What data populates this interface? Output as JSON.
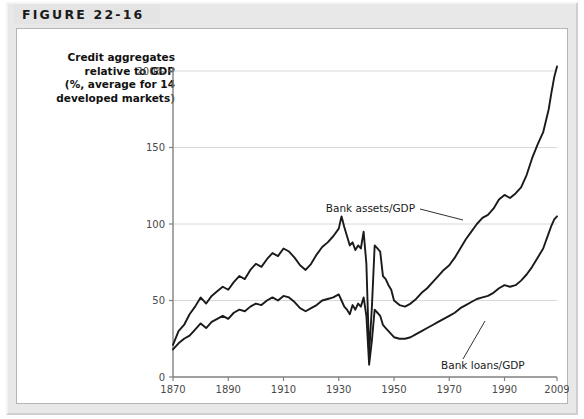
{
  "figure": {
    "tab_label": "FIGURE 22-16"
  },
  "axis_caption": {
    "line1": "Credit aggregates",
    "line2": "relative to GDP",
    "line3": "(%, average for 14",
    "line4": "developed markets)"
  },
  "annotations": {
    "assets_label": "Bank assets/GDP",
    "loans_label": "Bank loans/GDP"
  },
  "colors": {
    "line": "#1a1a1a",
    "grid": "#d8d8d8",
    "axis": "#808080",
    "panel_bg": "#ffffff",
    "mount_bg": "#e8e8e8",
    "tab_bg": "#e4e4e4",
    "tick_text": "#4a4a4a"
  },
  "chart_data": {
    "type": "line",
    "title": "",
    "xlabel": "",
    "ylabel": "Credit aggregates relative to GDP (%, average for 14 developed markets)",
    "xlim": [
      1870,
      2009
    ],
    "ylim": [
      0,
      200
    ],
    "yticks": [
      0,
      50,
      100,
      150,
      200
    ],
    "ytick_labels": [
      "0",
      "50",
      "100",
      "150",
      "200%"
    ],
    "xticks": [
      1870,
      1890,
      1910,
      1930,
      1950,
      1970,
      1990,
      2009
    ],
    "xtick_labels": [
      "1870",
      "1890",
      "1910",
      "1930",
      "1950",
      "1970",
      "1990",
      "2009"
    ],
    "grid": "horizontal",
    "legend": "annotated-inline",
    "series": [
      {
        "name": "Bank assets/GDP",
        "x": [
          1870,
          1872,
          1874,
          1876,
          1878,
          1880,
          1882,
          1884,
          1886,
          1888,
          1890,
          1892,
          1894,
          1896,
          1898,
          1900,
          1902,
          1904,
          1906,
          1908,
          1910,
          1912,
          1914,
          1916,
          1918,
          1920,
          1922,
          1924,
          1926,
          1928,
          1930,
          1931,
          1932,
          1933,
          1934,
          1935,
          1936,
          1937,
          1938,
          1939,
          1940,
          1941,
          1942,
          1943,
          1944,
          1945,
          1946,
          1947,
          1948,
          1949,
          1950,
          1952,
          1954,
          1956,
          1958,
          1960,
          1962,
          1964,
          1966,
          1968,
          1970,
          1972,
          1974,
          1976,
          1978,
          1980,
          1982,
          1984,
          1986,
          1988,
          1990,
          1992,
          1994,
          1996,
          1998,
          2000,
          2002,
          2004,
          2006,
          2007,
          2008,
          2009
        ],
        "values": [
          21,
          30,
          34,
          41,
          46,
          52,
          48,
          53,
          56,
          59,
          57,
          62,
          66,
          64,
          70,
          74,
          72,
          77,
          81,
          79,
          84,
          82,
          78,
          73,
          70,
          74,
          80,
          85,
          88,
          92,
          97,
          105,
          98,
          92,
          86,
          88,
          83,
          86,
          84,
          95,
          74,
          15,
          46,
          86,
          84,
          82,
          66,
          64,
          60,
          57,
          50,
          47,
          46,
          48,
          51,
          55,
          58,
          62,
          66,
          70,
          73,
          78,
          84,
          90,
          95,
          100,
          104,
          106,
          110,
          116,
          119,
          117,
          120,
          124,
          132,
          143,
          152,
          160,
          175,
          186,
          196,
          203
        ]
      },
      {
        "name": "Bank loans/GDP",
        "x": [
          1870,
          1872,
          1874,
          1876,
          1878,
          1880,
          1882,
          1884,
          1886,
          1888,
          1890,
          1892,
          1894,
          1896,
          1898,
          1900,
          1902,
          1904,
          1906,
          1908,
          1910,
          1912,
          1914,
          1916,
          1918,
          1920,
          1922,
          1924,
          1926,
          1928,
          1930,
          1931,
          1932,
          1933,
          1934,
          1935,
          1936,
          1937,
          1938,
          1939,
          1940,
          1941,
          1942,
          1943,
          1944,
          1945,
          1946,
          1947,
          1948,
          1949,
          1950,
          1952,
          1954,
          1956,
          1958,
          1960,
          1962,
          1964,
          1966,
          1968,
          1970,
          1972,
          1974,
          1976,
          1978,
          1980,
          1982,
          1984,
          1986,
          1988,
          1990,
          1992,
          1994,
          1996,
          1998,
          2000,
          2002,
          2004,
          2006,
          2007,
          2008,
          2009
        ],
        "values": [
          18,
          22,
          25,
          27,
          31,
          35,
          32,
          36,
          38,
          40,
          38,
          42,
          44,
          43,
          46,
          48,
          47,
          50,
          52,
          50,
          53,
          52,
          49,
          45,
          43,
          45,
          47,
          50,
          51,
          52,
          54,
          50,
          46,
          44,
          41,
          47,
          44,
          48,
          46,
          52,
          40,
          8,
          24,
          44,
          42,
          40,
          34,
          32,
          30,
          28,
          26,
          25,
          25,
          26,
          28,
          30,
          32,
          34,
          36,
          38,
          40,
          42,
          45,
          47,
          49,
          51,
          52,
          53,
          55,
          58,
          60,
          59,
          60,
          63,
          67,
          72,
          78,
          84,
          94,
          99,
          103,
          105
        ]
      }
    ]
  }
}
